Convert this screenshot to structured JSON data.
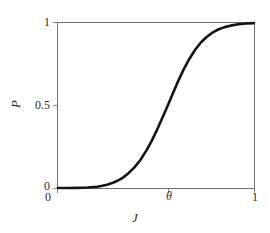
{
  "figure": {
    "background_color": "#ffffff",
    "frame_color": "#6e6e6e",
    "curve_color": "#141414"
  },
  "axes": {
    "y_title": "P",
    "x_title": "J",
    "y_ticks": [
      {
        "label": "0",
        "value": 0
      },
      {
        "label": "0.5",
        "value": 0.5
      },
      {
        "label": "1",
        "value": 1
      }
    ],
    "x_ticks": [
      {
        "label": "0",
        "value": 0
      },
      {
        "label": "θ",
        "value": 0.56
      },
      {
        "label": "1",
        "value": 1
      }
    ]
  },
  "chart_data": {
    "type": "line",
    "title": "",
    "subtitle": "",
    "xlabel": "J",
    "ylabel": "P",
    "xlim": [
      0,
      1
    ],
    "ylim": [
      0,
      1
    ],
    "grid": false,
    "legend": null,
    "xticks": [
      0,
      0.56,
      1
    ],
    "xticklabels": [
      "0",
      "θ",
      "1"
    ],
    "yticks": [
      0,
      0.5,
      1
    ],
    "yticklabels": [
      "0",
      "0.5",
      "1"
    ],
    "annotations": [
      {
        "text": "θ",
        "x": 0.56,
        "y": 0,
        "note": "threshold marker on x-axis with faint vertical guide"
      }
    ],
    "series": [
      {
        "name": "P(J)",
        "color": "#141414",
        "linewidth": 2.6,
        "description": "sigmoid / cumulative response curve rising from 0 to 1 with inflection near J = theta",
        "x": [
          0.0,
          0.05,
          0.1,
          0.15,
          0.2,
          0.22,
          0.25,
          0.28,
          0.3,
          0.33,
          0.36,
          0.39,
          0.42,
          0.45,
          0.48,
          0.51,
          0.54,
          0.56,
          0.58,
          0.61,
          0.64,
          0.67,
          0.7,
          0.73,
          0.76,
          0.79,
          0.82,
          0.85,
          0.88,
          0.92,
          0.96,
          1.0
        ],
        "y": [
          0.0,
          0.0,
          0.001,
          0.003,
          0.008,
          0.012,
          0.02,
          0.032,
          0.042,
          0.062,
          0.09,
          0.125,
          0.17,
          0.225,
          0.29,
          0.365,
          0.445,
          0.5,
          0.556,
          0.64,
          0.716,
          0.782,
          0.838,
          0.883,
          0.917,
          0.943,
          0.962,
          0.975,
          0.984,
          0.992,
          0.997,
          0.999
        ]
      }
    ]
  }
}
